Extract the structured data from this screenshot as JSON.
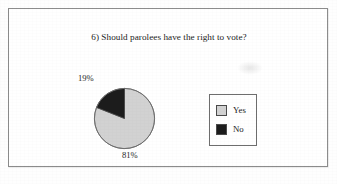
{
  "figure": {
    "title": "6) Should parolees have the right to vote?"
  },
  "legend": {
    "items": [
      {
        "label": "Yes",
        "swatch_color": "#d2d2d2",
        "swatch_name": "legend-swatch-yes"
      },
      {
        "label": "No",
        "swatch_color": "#1c1c1c",
        "swatch_name": "legend-swatch-no"
      }
    ]
  },
  "labels": {
    "yes_pct": "81%",
    "no_pct": "19%"
  },
  "colors": {
    "yes_slice": "#d2d2d2",
    "no_slice": "#1c1c1c",
    "slice_outline": "#6b6b6b",
    "frame_border": "#8c8c8c",
    "legend_border": "#6e6e6e",
    "page_background": "#ffffff",
    "text": "#242424"
  },
  "chart_data": {
    "type": "pie",
    "title": "6) Should parolees have the right to vote?",
    "categories": [
      "Yes",
      "No"
    ],
    "values": [
      81,
      19
    ],
    "value_unit": "%",
    "data_labels": [
      "81%",
      "19%"
    ],
    "colors": [
      "#d2d2d2",
      "#1c1c1c"
    ],
    "start_angle_deg": 90,
    "direction": "clockwise",
    "legend": true,
    "legend_position": "right",
    "grid": false,
    "xlabel": "",
    "ylabel": ""
  }
}
